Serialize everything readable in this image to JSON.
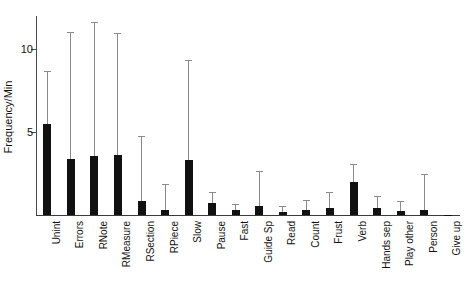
{
  "chart_data": {
    "type": "bar",
    "title": "",
    "xlabel": "",
    "ylabel": "Frequency/Min",
    "ylim": [
      0,
      12
    ],
    "yticks": [
      5,
      10
    ],
    "ytick_labels": [
      "5",
      "10"
    ],
    "grid": false,
    "legend": false,
    "error_bars": "upper only",
    "categories": [
      "Unint",
      "Errors",
      "RNote",
      "RMeasure",
      "RSection",
      "RPiece",
      "Slow",
      "Pause",
      "Fast",
      "Guide Sp",
      "Read",
      "Count",
      "Frust",
      "Verb",
      "Hands sep",
      "Play other",
      "Person",
      "Give up"
    ],
    "values": [
      5.5,
      3.35,
      3.55,
      3.6,
      0.85,
      0.3,
      3.3,
      0.75,
      0.3,
      0.55,
      0.2,
      0.3,
      0.4,
      2.0,
      0.45,
      0.25,
      0.3,
      0.02
    ],
    "error_upper": [
      8.6,
      11.0,
      11.6,
      10.9,
      4.7,
      1.8,
      9.3,
      1.3,
      0.6,
      2.6,
      0.5,
      0.85,
      1.3,
      3.0,
      1.1,
      0.8,
      2.4,
      0.0
    ]
  },
  "axis": {
    "y_label": "Frequency/Min"
  }
}
